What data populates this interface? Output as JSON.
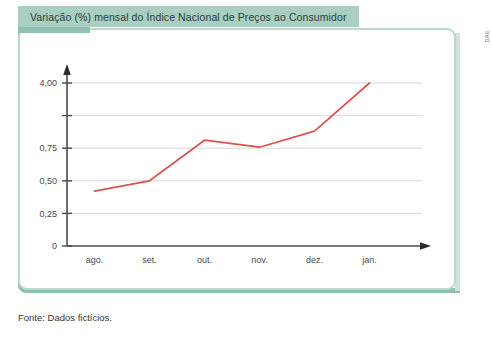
{
  "title": "Variação (%) mensal do Índice Nacional de Preços ao Consumidor",
  "credit": "DAE",
  "source_note": "Fonte: Dados fictícios.",
  "colors": {
    "line": "#d9534f",
    "frame": "#bcd9cf",
    "frame_shadow": "#8fc0b2",
    "banner": "#a8cfc2",
    "grid": "#d7d7d7",
    "axis": "#4a4a4a"
  },
  "chart_data": {
    "type": "line",
    "title": "Variação (%) mensal do Índice Nacional de Preços ao Consumidor",
    "xlabel": "",
    "ylabel": "",
    "categories": [
      "ago.",
      "set.",
      "out.",
      "nov.",
      "dez.",
      "jan."
    ],
    "values": [
      0.42,
      0.5,
      1.15,
      0.8,
      1.6,
      4.0
    ],
    "series": [
      {
        "name": "Variação (%) mensal",
        "values": [
          0.42,
          0.5,
          1.15,
          0.8,
          1.6,
          4.0
        ]
      }
    ],
    "ytick_labels": [
      "0",
      "0,25",
      "0,50",
      "0,75",
      "",
      "4,00"
    ],
    "ytick_values": [
      0,
      0.25,
      0.5,
      0.75,
      null,
      4.0
    ],
    "ylim": [
      0,
      4.0
    ],
    "grid": true,
    "legend": "none",
    "axis_arrows": true,
    "note": "Eixo vertical com escala irregular: marcas igualmente espaçadas rotuladas 0; 0,25; 0,50; 0,75; (sem rótulo); 4,00."
  }
}
